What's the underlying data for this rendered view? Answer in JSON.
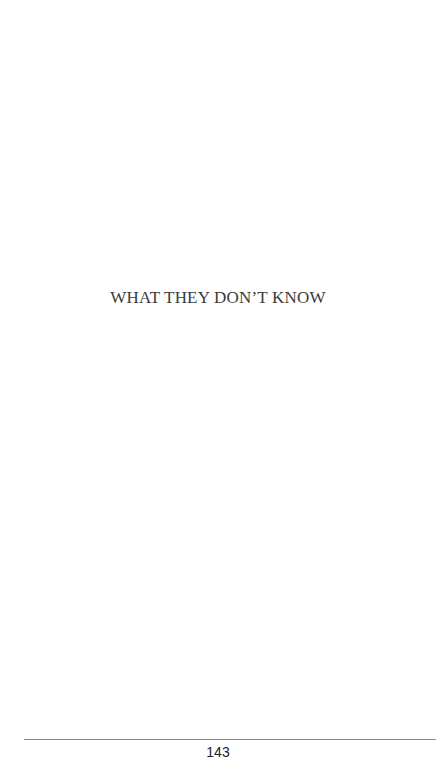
{
  "page": {
    "title": "WHAT THEY DON’T KNOW",
    "page_number": "143"
  }
}
